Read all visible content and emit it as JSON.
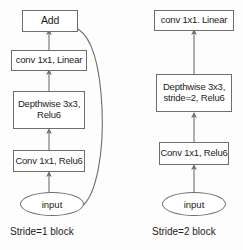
{
  "figure": {
    "background_color": "#fdfdfd",
    "stroke_color": "#6e6e6e",
    "text_color": "#1c1c1c"
  },
  "blocks": [
    {
      "id": "stride1",
      "caption": "Stride=1 block",
      "has_residual": true,
      "nodes": [
        {
          "id": "add",
          "label": "Add",
          "shape": "rect"
        },
        {
          "id": "conv_out",
          "label": "conv 1x1, Linear",
          "shape": "rect"
        },
        {
          "id": "depthwise",
          "label": "Depthwise 3x3,\nRelu6",
          "shape": "rect"
        },
        {
          "id": "conv_in",
          "label": "Conv 1x1, Relu6",
          "shape": "rect"
        },
        {
          "id": "input",
          "label": "input",
          "shape": "ellipse"
        }
      ],
      "edges": [
        {
          "from": "input",
          "to": "conv_in",
          "type": "arrow"
        },
        {
          "from": "conv_in",
          "to": "depthwise",
          "type": "arrow"
        },
        {
          "from": "depthwise",
          "to": "conv_out",
          "type": "arrow"
        },
        {
          "from": "conv_out",
          "to": "add",
          "type": "arrow"
        },
        {
          "from": "input",
          "to": "add",
          "type": "skip-curve"
        }
      ]
    },
    {
      "id": "stride2",
      "caption": "Stride=2 block",
      "has_residual": false,
      "nodes": [
        {
          "id": "conv_out",
          "label": "conv 1x1. Linear",
          "shape": "rect"
        },
        {
          "id": "depthwise",
          "label": "Depthwise 3x3,\nstride=2, Relu6",
          "shape": "rect"
        },
        {
          "id": "conv_in",
          "label": "Conv 1x1, Relu6",
          "shape": "rect"
        },
        {
          "id": "input",
          "label": "input",
          "shape": "ellipse"
        }
      ],
      "edges": [
        {
          "from": "input",
          "to": "conv_in",
          "type": "arrow"
        },
        {
          "from": "conv_in",
          "to": "depthwise",
          "type": "arrow"
        },
        {
          "from": "depthwise",
          "to": "conv_out",
          "type": "arrow"
        }
      ]
    }
  ]
}
